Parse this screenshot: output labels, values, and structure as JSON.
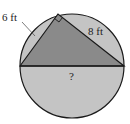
{
  "diagram": {
    "type": "inscribed-right-triangle",
    "labels": {
      "leg_left": "6 ft",
      "leg_right": "8 ft",
      "diameter": "?"
    },
    "colors": {
      "background": "#ffffff",
      "circle_fill": "#c4c4c4",
      "triangle_fill": "#8a8a8a",
      "stroke": "#1a1a1a",
      "text": "#222222"
    }
  }
}
